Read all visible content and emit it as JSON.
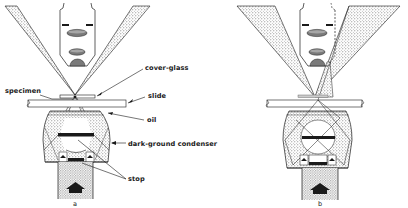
{
  "figure": {
    "type": "optical-diagram",
    "ink_color": "#1a1a1a",
    "stipple_color": "#6e6e6e",
    "background": "#ffffff"
  },
  "labels": {
    "cover_glass": "cover-glass",
    "slide": "slide",
    "specimen": "specimen",
    "oil": "oil",
    "condenser": "dark-ground condenser",
    "stop": "stop"
  },
  "panels": [
    {
      "id": "a",
      "caption": "a"
    },
    {
      "id": "b",
      "caption": "b"
    }
  ]
}
